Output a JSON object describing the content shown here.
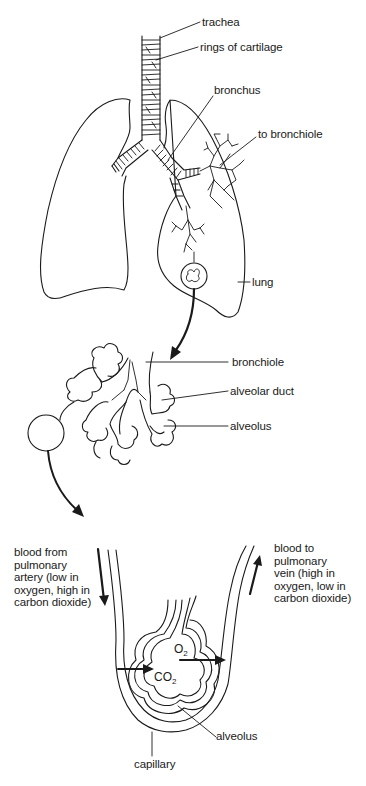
{
  "diagram": {
    "labels": {
      "trachea": "trachea",
      "rings_of_cartilage": "rings of cartilage",
      "bronchus": "bronchus",
      "to_bronchiole": "to bronchiole",
      "lung": "lung",
      "bronchiole": "bronchiole",
      "alveolar_duct": "alveolar duct",
      "alveolus_upper": "alveolus",
      "blood_from": "blood from\npulmonary\nartery (low in\noxygen, high in\ncarbon dioxide)",
      "blood_to": "blood to\npulmonary\nvein (high in\noxygen, low in\ncarbon dioxide)",
      "o2_symbol": "O",
      "o2_sub": "2",
      "co2_symbol": "CO",
      "co2_sub": "2",
      "alveolus_lower": "alveolus",
      "capillary": "capillary"
    },
    "colors": {
      "ink": "#1a1a1a",
      "background": "#ffffff",
      "bleed_through_text": "#d9d9d9"
    }
  }
}
